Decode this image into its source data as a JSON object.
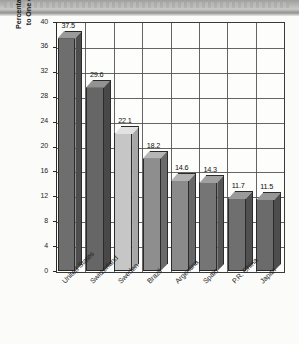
{
  "chart_data": {
    "type": "bar",
    "title": "",
    "subtitle": "",
    "xlabel": "",
    "ylabel": "Percentage of Adults Belonging to One or More Organizations",
    "ylabel_line1": "Percentage of Adults Belonging",
    "ylabel_line2": "to One or More Organizations",
    "categories": [
      "United States",
      "Switzerland",
      "Sweden",
      "Brazil",
      "Argentina",
      "Spain",
      "P.R. China",
      "Japan"
    ],
    "values": [
      37.5,
      29.6,
      22.1,
      18.2,
      14.6,
      14.3,
      11.7,
      11.5
    ],
    "value_labels": [
      "37.5",
      "29.6",
      "22.1",
      "18.2",
      "14.6",
      "14.3",
      "11.7",
      "11.5"
    ],
    "ylim": [
      0,
      40
    ],
    "yticks": [
      0,
      4,
      8,
      12,
      16,
      20,
      24,
      28,
      32,
      36,
      40
    ],
    "ytick_labels": [
      "0",
      "4",
      "8",
      "12",
      "16",
      "20",
      "24",
      "28",
      "32",
      "36",
      "40"
    ],
    "grid": true,
    "grid_axis": "both",
    "legend": false,
    "legend_position": "none",
    "style": "3d-bar-scanned-grayscale",
    "bar_colors": [
      "#6e6e6e",
      "#666666",
      "#c6c6c6",
      "#8e8e8e",
      "#8a8a8a",
      "#757575",
      "#6f6f6f",
      "#6b6b6b"
    ],
    "bar_top_colors": [
      "#9a9a9a",
      "#939393",
      "#e2e2e2",
      "#b6b6b6",
      "#b2b2b2",
      "#a0a0a0",
      "#9a9a9a",
      "#969696"
    ],
    "bar_side_colors": [
      "#4e4e4e",
      "#484848",
      "#a6a6a6",
      "#6a6a6a",
      "#676767",
      "#555555",
      "#505050",
      "#4d4d4d"
    ],
    "background_color": "#fdfdfc",
    "axis_color": "#3a3a3a",
    "text_color": "#1d1d1d"
  },
  "page": {
    "scan_banner_present": true
  }
}
